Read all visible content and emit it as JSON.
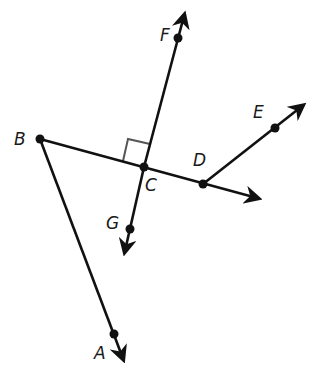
{
  "diagram": {
    "type": "geometry",
    "stroke_color": "#111111",
    "right_angle_marker_color": "#555555",
    "points": [
      {
        "id": "B",
        "label": "B",
        "x": 40,
        "y": 139
      },
      {
        "id": "C",
        "label": "C",
        "x": 144,
        "y": 167
      },
      {
        "id": "D",
        "label": "D",
        "x": 203,
        "y": 184
      },
      {
        "id": "E",
        "label": "E",
        "x": 275,
        "y": 128
      },
      {
        "id": "F",
        "label": "F",
        "x": 178,
        "y": 38
      },
      {
        "id": "G",
        "label": "G",
        "x": 130,
        "y": 229
      },
      {
        "id": "A",
        "label": "A",
        "x": 114,
        "y": 334
      }
    ],
    "rays": [
      {
        "name": "ray-BD",
        "from": "B",
        "through": "D",
        "arrow_tip": [
          261,
          199
        ]
      },
      {
        "name": "ray-CF",
        "from": "C",
        "through": "F",
        "arrow_tip": [
          185,
          12
        ]
      },
      {
        "name": "ray-CG",
        "from": "C",
        "through": "G",
        "arrow_tip": [
          124,
          255
        ]
      },
      {
        "name": "ray-DE",
        "from": "D",
        "through": "E",
        "arrow_tip": [
          305,
          104
        ]
      },
      {
        "name": "ray-BA",
        "from": "B",
        "through": "A",
        "arrow_tip": [
          124,
          362
        ]
      }
    ],
    "right_angle": {
      "at": "C",
      "between": [
        "B",
        "F"
      ]
    }
  },
  "labels": {
    "A": "A",
    "B": "B",
    "C": "C",
    "D": "D",
    "E": "E",
    "F": "F",
    "G": "G"
  }
}
